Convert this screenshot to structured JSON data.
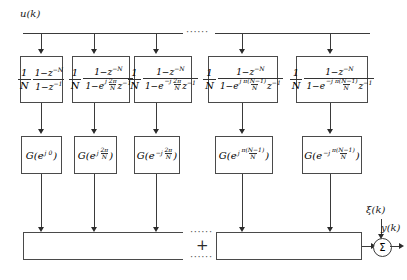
{
  "figure": {
    "input_label": "u(k)",
    "output_label": "y(k)",
    "noise_label": "ξ(k)",
    "sum_symbol": "Σ",
    "plus_symbol": "+",
    "dots": "······",
    "ellipsis_top": "······",
    "ellipsis_mid": "·····",
    "ellipsis_bottom": "······"
  },
  "filter_row": {
    "gain_num": "1",
    "gain_den": "N",
    "numerator": "1−z",
    "numerator_exp": "−N",
    "blocks": [
      {
        "id": "comb-0",
        "den_prefix": "1−z",
        "den_exp": "−1",
        "has_exponential": false,
        "exp_sign": "",
        "exp_num": "",
        "exp_den": "",
        "den_suffix": ""
      },
      {
        "id": "comb-1",
        "den_prefix": "1−e",
        "den_exp": "",
        "has_exponential": true,
        "exp_sign": "j",
        "exp_num": "2π",
        "exp_den": "N",
        "den_suffix": "z",
        "den_suffix_exp": "−1"
      },
      {
        "id": "comb-2",
        "den_prefix": "1−e",
        "den_exp": "",
        "has_exponential": true,
        "exp_sign": "−j",
        "exp_num": "2π",
        "exp_den": "N",
        "den_suffix": "z",
        "den_suffix_exp": "−1"
      },
      {
        "id": "comb-3",
        "den_prefix": "1−e",
        "den_exp": "",
        "has_exponential": true,
        "exp_sign": "j",
        "exp_num": "π(N−1)",
        "exp_den": "N",
        "den_suffix": "z",
        "den_suffix_exp": "−1"
      },
      {
        "id": "comb-4",
        "den_prefix": "1−e",
        "den_exp": "",
        "has_exponential": true,
        "exp_sign": "−j",
        "exp_num": "π(N−1)",
        "exp_den": "N",
        "den_suffix": "z",
        "den_suffix_exp": "−1"
      }
    ]
  },
  "gain_row": {
    "blocks": [
      {
        "id": "gain-0",
        "prefix": "G(e",
        "exp_sign": "j",
        "exp_simple": "0",
        "is_fraction": false,
        "exp_num": "",
        "exp_den": "",
        "suffix": ")"
      },
      {
        "id": "gain-1",
        "prefix": "G(e",
        "exp_sign": "j",
        "exp_simple": "",
        "is_fraction": true,
        "exp_num": "2π",
        "exp_den": "N",
        "suffix": ")"
      },
      {
        "id": "gain-2",
        "prefix": "G(e",
        "exp_sign": "−j",
        "exp_simple": "",
        "is_fraction": true,
        "exp_num": "2π",
        "exp_den": "N",
        "suffix": ")"
      },
      {
        "id": "gain-3",
        "prefix": "G(e",
        "exp_sign": "j",
        "exp_simple": "",
        "is_fraction": true,
        "exp_num": "π(N−1)",
        "exp_den": "N",
        "suffix": ")"
      },
      {
        "id": "gain-4",
        "prefix": "G(e",
        "exp_sign": "−j",
        "exp_simple": "",
        "is_fraction": true,
        "exp_num": "π(N−1)",
        "exp_den": "N",
        "suffix": ")"
      }
    ]
  }
}
